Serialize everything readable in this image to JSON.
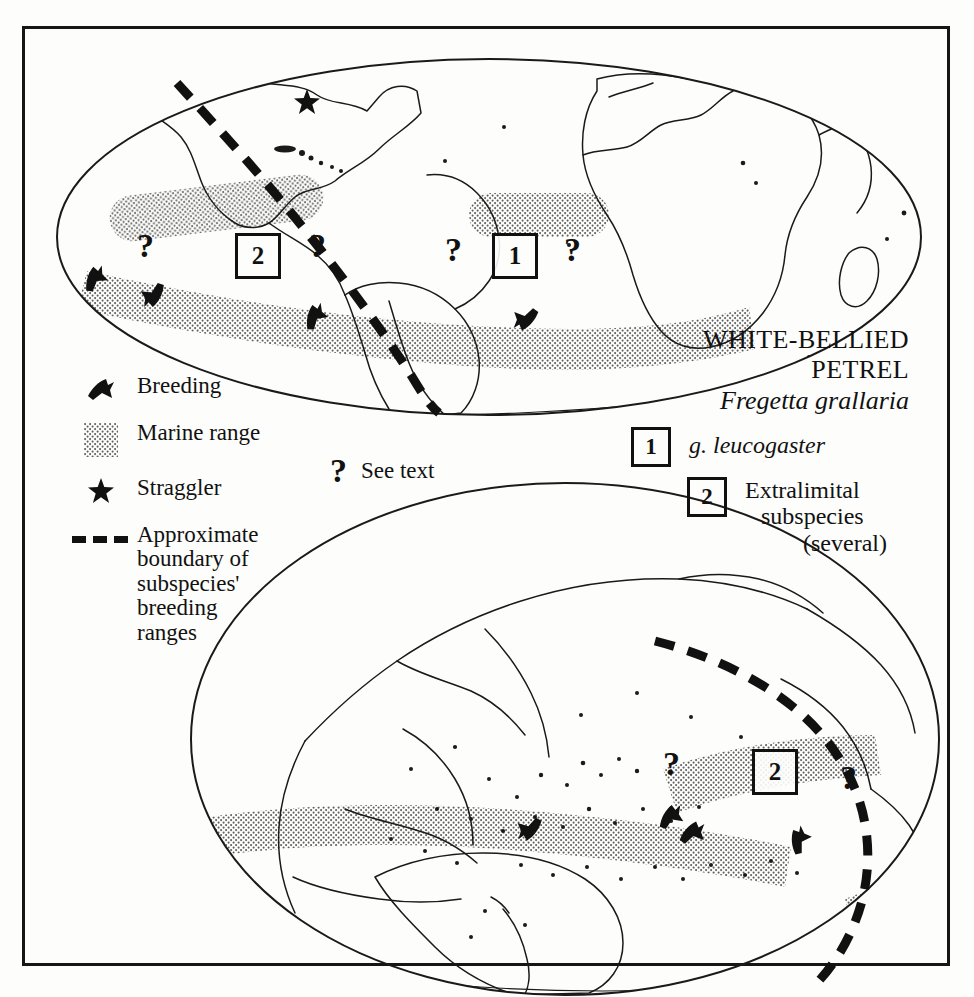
{
  "title": {
    "line1": "WHITE-BELLIED",
    "line2": "PETREL",
    "scientific": "Fregetta grallaria"
  },
  "legend": {
    "items": [
      {
        "symbol": "breeding-bird-icon",
        "label": "Breeding"
      },
      {
        "symbol": "marine-range-swatch",
        "label": "Marine range"
      },
      {
        "symbol": "star-icon",
        "label": "Straggler"
      },
      {
        "symbol": "dashed-line-icon",
        "label": "Approximate boundary of subspecies' breeding ranges"
      }
    ],
    "see_text": {
      "symbol": "?",
      "label": "See text"
    },
    "boundary_lines": [
      "Approximate",
      "boundary of",
      "subspecies'",
      "breeding",
      "ranges"
    ]
  },
  "subspecies_key": [
    {
      "box": "1",
      "label": "g. leucogaster",
      "italic": true
    },
    {
      "box": "2",
      "label": "Extralimital subspecies (several)",
      "italic": false,
      "lines": [
        "Extralimital",
        "subspecies",
        "(several)"
      ]
    }
  ],
  "maps": [
    {
      "id": "north-map",
      "name": "atlantic-centered-world-map",
      "projection": "oval",
      "markers": {
        "number_boxes": [
          {
            "value": "2",
            "x": 205,
            "y": 196
          },
          {
            "value": "1",
            "x": 462,
            "y": 196
          }
        ],
        "question_marks": [
          {
            "x": 96,
            "y": 192
          },
          {
            "x": 268,
            "y": 192
          },
          {
            "x": 404,
            "y": 196
          },
          {
            "x": 523,
            "y": 196
          }
        ],
        "breeding": [
          {
            "x": 45,
            "y": 222
          },
          {
            "x": 105,
            "y": 238
          },
          {
            "x": 265,
            "y": 258
          },
          {
            "x": 477,
            "y": 262
          }
        ],
        "stragglers": [
          {
            "x": 258,
            "y": 45
          }
        ]
      }
    },
    {
      "id": "south-map",
      "name": "pacific-centered-world-map",
      "projection": "oval",
      "markers": {
        "number_boxes": [
          {
            "value": "2",
            "x": 739,
            "y": 742
          }
        ],
        "question_marks": [
          {
            "x": 645,
            "y": 740
          },
          {
            "x": 822,
            "y": 752
          }
        ],
        "breeding": [
          {
            "x": 502,
            "y": 805
          },
          {
            "x": 639,
            "y": 792
          },
          {
            "x": 661,
            "y": 805
          },
          {
            "x": 765,
            "y": 812
          }
        ],
        "stragglers": []
      }
    }
  ],
  "colors": {
    "ink": "#111111",
    "paper": "#fdfdfb",
    "stipple": "#6d6d6d"
  }
}
